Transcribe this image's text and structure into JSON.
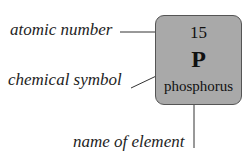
{
  "diagram": {
    "element_tile": {
      "atomic_number": "15",
      "symbol": "P",
      "name": "phosphorus",
      "fill_color": "#a9a9a9",
      "border_color": "#555555"
    },
    "labels": {
      "atomic_number": "atomic number",
      "chemical_symbol": "chemical symbol",
      "element_name": "name of element"
    }
  }
}
